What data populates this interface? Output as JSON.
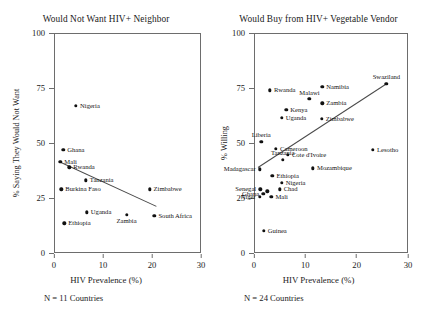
{
  "figure": {
    "background": "#ffffff",
    "point_color": "#111111",
    "line_color": "#4a4a4a",
    "axis_color": "#6d6d6d"
  },
  "chart_data": [
    {
      "type": "scatter",
      "panel": "left",
      "title": "Would Not Want HIV+ Neighbor",
      "xlabel": "HIV Prevalence (%)",
      "ylabel": "% Saying They Would Not Want",
      "xlim": [
        0,
        30
      ],
      "ylim": [
        0,
        100
      ],
      "xticks": [
        0,
        10,
        20,
        30
      ],
      "yticks": [
        0,
        25,
        50,
        75,
        100
      ],
      "grid": false,
      "legend": "none",
      "note": "N = 11 Countries",
      "n_countries": 11,
      "trendline": {
        "x0": 1.5,
        "y0": 41.5,
        "x1": 21.0,
        "y1": 21.5,
        "slope": "negative"
      },
      "points": [
        {
          "label": "Nigeria",
          "x": 4.5,
          "y": 67.0,
          "label_pos": "r"
        },
        {
          "label": "Ghana",
          "x": 1.9,
          "y": 47.0,
          "label_pos": "r"
        },
        {
          "label": "Mali",
          "x": 1.3,
          "y": 41.5,
          "label_pos": "r"
        },
        {
          "label": "Rwanda",
          "x": 3.1,
          "y": 39.0,
          "label_pos": "r"
        },
        {
          "label": "Tanzania",
          "x": 6.5,
          "y": 33.0,
          "label_pos": "r"
        },
        {
          "label": "Burkina Faso",
          "x": 1.5,
          "y": 29.0,
          "label_pos": "r"
        },
        {
          "label": "Zimbabwe",
          "x": 19.5,
          "y": 29.0,
          "label_pos": "r"
        },
        {
          "label": "Uganda",
          "x": 6.7,
          "y": 18.5,
          "label_pos": "r"
        },
        {
          "label": "Zambia",
          "x": 14.8,
          "y": 17.5,
          "label_pos": "c-below"
        },
        {
          "label": "South Africa",
          "x": 20.5,
          "y": 17.0,
          "label_pos": "r"
        },
        {
          "label": "Ethiopia",
          "x": 2.1,
          "y": 13.5,
          "label_pos": "r"
        }
      ]
    },
    {
      "type": "scatter",
      "panel": "right",
      "title": "Would Buy from HIV+ Vegetable Vendor",
      "xlabel": "HIV Prevalence (%)",
      "ylabel": "% Willing",
      "xlim": [
        0,
        30
      ],
      "ylim": [
        0,
        100
      ],
      "xticks": [
        0,
        10,
        20,
        30
      ],
      "yticks": [
        0,
        25,
        50,
        75,
        100
      ],
      "grid": false,
      "legend": "none",
      "note": "N = 24 Countries",
      "n_countries": 24,
      "trendline": {
        "x0": 0.8,
        "y0": 39.0,
        "x1": 25.8,
        "y1": 77.0,
        "slope": "positive"
      },
      "points": [
        {
          "label": "Swaziland",
          "x": 25.8,
          "y": 77.0,
          "label_pos": "above"
        },
        {
          "label": "Namibia",
          "x": 13.3,
          "y": 75.5,
          "label_pos": "r"
        },
        {
          "label": "Rwanda",
          "x": 3.1,
          "y": 74.0,
          "label_pos": "r"
        },
        {
          "label": "Malawi",
          "x": 10.8,
          "y": 70.0,
          "label_pos": "above"
        },
        {
          "label": "Zambia",
          "x": 13.3,
          "y": 68.0,
          "label_pos": "r"
        },
        {
          "label": "Kenya",
          "x": 6.3,
          "y": 65.0,
          "label_pos": "r"
        },
        {
          "label": "Uganda",
          "x": 5.4,
          "y": 61.5,
          "label_pos": "r"
        },
        {
          "label": "Zimbabwe",
          "x": 13.2,
          "y": 61.0,
          "label_pos": "r"
        },
        {
          "label": "Liberia",
          "x": 1.4,
          "y": 50.5,
          "label_pos": "above"
        },
        {
          "label": "Cameroon",
          "x": 4.3,
          "y": 47.5,
          "label_pos": "r"
        },
        {
          "label": "Lesotho",
          "x": 23.2,
          "y": 47.0,
          "label_pos": "r"
        },
        {
          "label": "Cote d'Ivoire",
          "x": 6.6,
          "y": 44.5,
          "label_pos": "r"
        },
        {
          "label": "Tanzania",
          "x": 5.6,
          "y": 42.5,
          "label_pos": "above"
        },
        {
          "label": "Mozambique",
          "x": 11.5,
          "y": 38.5,
          "label_pos": "r"
        },
        {
          "label": "Madagascar",
          "x": 1.1,
          "y": 38.0,
          "label_pos": "l"
        },
        {
          "label": "Ethiopia",
          "x": 3.6,
          "y": 35.0,
          "label_pos": "r"
        },
        {
          "label": "Nigeria",
          "x": 5.4,
          "y": 32.0,
          "label_pos": "r"
        },
        {
          "label": "Senegal",
          "x": 1.2,
          "y": 29.0,
          "label_pos": "l"
        },
        {
          "label": "Chad",
          "x": 5.0,
          "y": 29.0,
          "label_pos": "r"
        },
        {
          "label": "Ghana",
          "x": 1.8,
          "y": 27.0,
          "label_pos": "l"
        },
        {
          "label": "Burkina Faso",
          "x": 2.6,
          "y": 28.0,
          "label_pos": "none"
        },
        {
          "label": "Mali",
          "x": 3.4,
          "y": 25.5,
          "label_pos": "r"
        },
        {
          "label": "Niger",
          "x": 1.1,
          "y": 25.5,
          "label_pos": "l"
        },
        {
          "label": "Guinea",
          "x": 1.9,
          "y": 10.0,
          "label_pos": "r"
        }
      ]
    }
  ]
}
